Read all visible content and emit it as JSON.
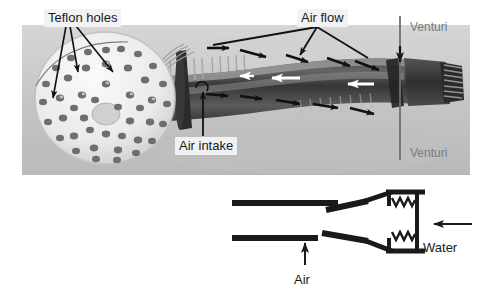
{
  "figure": {
    "background_color": "#ffffff",
    "photo": {
      "name": "showerhead-venturi-photo",
      "bounds": {
        "x": 22,
        "y": 25,
        "width": 448,
        "height": 150
      },
      "base_color": "#c9c9c9",
      "description": "Grayscale photograph of a white showerhead face with many drilled holes, attached to a ribbed flexible hose ending in a threaded metal connector",
      "showerhead": {
        "name": "showerhead-face",
        "color": "#ededed",
        "center_hole_color": "#d0d0d0",
        "hole_count": 45,
        "hole_color": "#6e6e6e"
      },
      "hose": {
        "name": "flexible-hose",
        "color": "#4a4a4a",
        "rib_color": "#9a9a9a",
        "description": "corrugated / ribbed translucent hose curving up to the right"
      },
      "connector": {
        "name": "threaded-connector",
        "color": "#3c3c3c"
      }
    },
    "annotations": {
      "teflon_holes": {
        "label": "Teflon holes",
        "name": "label-teflon-holes",
        "leader_count": 3,
        "text_color": "#1a1a1a",
        "box_color": "#f2f2f2"
      },
      "air_flow": {
        "label": "Air flow",
        "name": "label-air-flow",
        "leader_count": 3,
        "text_color": "#1a1a1a",
        "box_color": "#f2f2f2"
      },
      "air_intake": {
        "label": "Air intake",
        "name": "label-air-intake",
        "leader_count": 1,
        "text_color": "#1a1a1a",
        "box_color": "#f2f2f2"
      },
      "venturi_top": {
        "label": "Venturi",
        "name": "label-venturi-top",
        "text_color": "#7b7b7b"
      },
      "venturi_bottom": {
        "label": "Venturi",
        "name": "label-venturi-bottom",
        "text_color": "#7b7b7b"
      },
      "arrow_color": "#111111",
      "air_flow_arrows_upper": 5,
      "air_flow_arrows_lower": 5,
      "water_flow_arrows": 2
    },
    "diagram": {
      "name": "venturi-schematic",
      "line_color": "#1a1a1a",
      "air_label": "Air",
      "water_label": "Water",
      "air_arrow_direction": "up",
      "water_arrow_direction": "left",
      "spring_symbol_count": 2,
      "description": "Schematic cross-section: two parallel pipe walls open at left, converging venturi throat at right, water inlet at far right, air drawn in at the gap"
    }
  }
}
